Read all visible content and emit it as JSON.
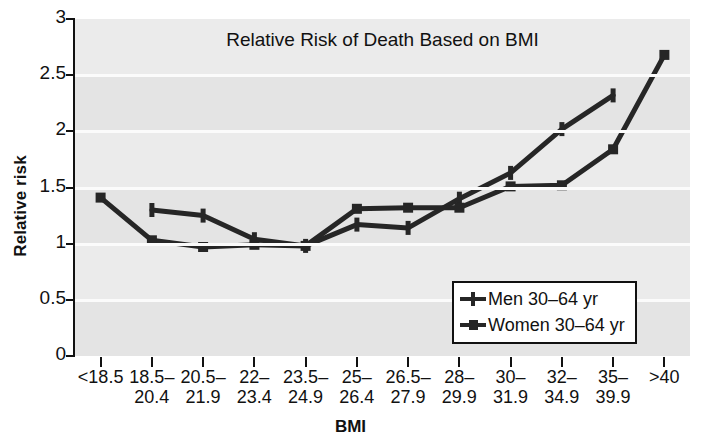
{
  "chart_data": {
    "type": "line",
    "title": "Relative Risk of Death Based on BMI",
    "xlabel": "BMI",
    "ylabel": "Relative risk",
    "grid": true,
    "legend_position": "inside-bottom-right",
    "ylim": [
      0,
      3
    ],
    "yticks": [
      "0",
      "0.5",
      "1",
      "1.5",
      "2",
      "2.5",
      "3"
    ],
    "categories": [
      {
        "l1": "<18.5",
        "l2": ""
      },
      {
        "l1": "18.5–",
        "l2": "20.4"
      },
      {
        "l1": "20.5–",
        "l2": "21.9"
      },
      {
        "l1": "22–",
        "l2": "23.4"
      },
      {
        "l1": "23.5–",
        "l2": "24.9"
      },
      {
        "l1": "25–",
        "l2": "26.4"
      },
      {
        "l1": "26.5–",
        "l2": "27.9"
      },
      {
        "l1": "28–",
        "l2": "29.9"
      },
      {
        "l1": "30–",
        "l2": "31.9"
      },
      {
        "l1": "32–",
        "l2": "34.9"
      },
      {
        "l1": "35–",
        "l2": "39.9"
      },
      {
        "l1": ">40",
        "l2": ""
      }
    ],
    "series": [
      {
        "name": "Men 30–64 yr",
        "marker": "plus",
        "color": "#262626",
        "values": [
          null,
          1.3,
          1.25,
          1.04,
          0.98,
          1.17,
          1.14,
          1.4,
          1.63,
          2.02,
          2.32,
          null
        ]
      },
      {
        "name": "Women 30–64 yr",
        "marker": "square",
        "color": "#262626",
        "values": [
          1.41,
          1.03,
          0.97,
          0.99,
          0.98,
          1.31,
          1.32,
          1.32,
          1.51,
          1.52,
          1.84,
          2.68
        ]
      }
    ]
  }
}
